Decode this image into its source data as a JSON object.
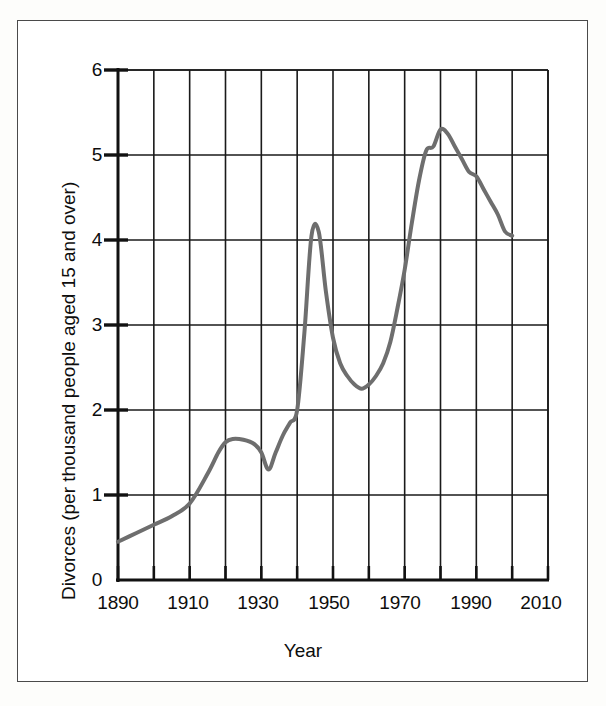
{
  "chart_data": {
    "type": "line",
    "title": "",
    "xlabel": "Year",
    "ylabel": "Divorces (per thousand people aged 15 and over)",
    "xlim": [
      1890,
      2010
    ],
    "ylim": [
      0,
      6
    ],
    "xticks": [
      1890,
      1900,
      1910,
      1920,
      1930,
      1940,
      1950,
      1960,
      1970,
      1980,
      1990,
      2000,
      2010
    ],
    "xtick_labels": [
      "1890",
      "",
      "1910",
      "",
      "1930",
      "",
      "1950",
      "",
      "1970",
      "",
      "1990",
      "",
      "2010"
    ],
    "xtick_labels_shown": [
      "1890",
      "1910",
      "1930",
      "1950",
      "1970",
      "1990",
      "2010"
    ],
    "yticks": [
      0,
      1,
      2,
      3,
      4,
      5,
      6
    ],
    "ytick_labels": [
      "0",
      "1",
      "2",
      "3",
      "4",
      "5",
      "6"
    ],
    "grid": true,
    "grid_color": "#1a1a1a",
    "legend": false,
    "line_color": "#6e6e6e",
    "line_width": 4,
    "series": [
      {
        "name": "Divorce rate",
        "x": [
          1890,
          1895,
          1900,
          1905,
          1910,
          1915,
          1918,
          1920,
          1922,
          1925,
          1928,
          1930,
          1932,
          1934,
          1936,
          1938,
          1940,
          1942,
          1944,
          1946,
          1948,
          1950,
          1952,
          1954,
          1956,
          1958,
          1960,
          1962,
          1964,
          1966,
          1968,
          1970,
          1972,
          1974,
          1976,
          1978,
          1980,
          1982,
          1984,
          1986,
          1988,
          1990,
          1992,
          1994,
          1996,
          1998,
          2000
        ],
        "y": [
          0.45,
          0.55,
          0.65,
          0.75,
          0.9,
          1.25,
          1.5,
          1.62,
          1.66,
          1.65,
          1.6,
          1.5,
          1.3,
          1.5,
          1.7,
          1.85,
          2.0,
          2.9,
          4.05,
          4.1,
          3.4,
          2.85,
          2.55,
          2.4,
          2.3,
          2.25,
          2.3,
          2.4,
          2.55,
          2.8,
          3.2,
          3.65,
          4.2,
          4.7,
          5.05,
          5.1,
          5.3,
          5.25,
          5.1,
          4.95,
          4.8,
          4.75,
          4.6,
          4.45,
          4.3,
          4.1,
          4.05
        ]
      }
    ]
  },
  "axis": {
    "y_title": "Divorces (per thousand people aged 15 and over)",
    "x_title": "Year",
    "y_labels": [
      "6",
      "5",
      "4",
      "3",
      "2",
      "1",
      "0"
    ],
    "x_labels": [
      "1890",
      "1910",
      "1930",
      "1950",
      "1970",
      "1990",
      "2010"
    ]
  }
}
